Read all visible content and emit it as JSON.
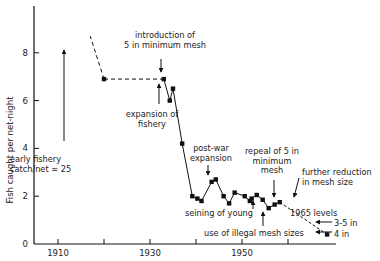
{
  "chart_data": {
    "type": "line",
    "title": "",
    "xlabel": "",
    "ylabel": "Fish caught per net-night",
    "xlim": [
      1899,
      1974
    ],
    "ylim": [
      0,
      9.8
    ],
    "grid": false,
    "legend": null,
    "x_ticks": [
      1910,
      1920,
      1930,
      1940,
      1950,
      1960
    ],
    "x_tick_labels": [
      "1910",
      "",
      "1930",
      "",
      "1950",
      ""
    ],
    "y_ticks": [
      0,
      2,
      4,
      6,
      8
    ],
    "y_tick_labels": [
      "0",
      "2",
      "4",
      "6",
      "8"
    ],
    "series": [
      {
        "name": "catch per net-night",
        "x": [
          1920,
          1933,
          1934.3,
          1935,
          1937,
          1939.2,
          1940.3,
          1941.2,
          1943.4,
          1944.3,
          1946,
          1947.2,
          1948.4,
          1950.6,
          1951.7,
          1952.1,
          1953.2,
          1954.5,
          1955.8,
          1957.1,
          1958.2
        ],
        "y": [
          6.9,
          6.9,
          6.0,
          6.5,
          4.2,
          2.0,
          1.9,
          1.8,
          2.6,
          2.7,
          2.0,
          1.7,
          2.15,
          2.0,
          1.8,
          1.9,
          2.05,
          1.85,
          1.5,
          1.65,
          1.75
        ]
      },
      {
        "name": "1965 levels (extrapolated)",
        "x": [
          1958.2,
          1968.5
        ],
        "y": [
          1.75,
          0.4
        ],
        "style": "dashed"
      }
    ],
    "early_fishery_dashed": {
      "from": [
        1920,
        6.9
      ],
      "to": [
        1917,
        8.7
      ]
    },
    "annotations": [
      {
        "text": [
          "early fishery",
          "catch/net ≃ 25"
        ],
        "x": 1913,
        "y": 6.9,
        "arrow": "up"
      },
      {
        "text": [
          "introduction of",
          "5 in minimum mesh"
        ],
        "x": 1933,
        "y": 7.9,
        "arrow": "down"
      },
      {
        "text": [
          "expansion of",
          "fishery"
        ],
        "x": 1932.5,
        "y": 5.8,
        "arrow": "up"
      },
      {
        "text": [
          "post-war",
          "expansion"
        ],
        "x": 1944,
        "y": 3.8,
        "arrow": "down"
      },
      {
        "text": [
          "seining of young"
        ],
        "x": 1951.7,
        "y": 1.2,
        "arrow": "up"
      },
      {
        "text": [
          "use of illegal mesh sizes"
        ],
        "x": 1955.8,
        "y": 0.5,
        "arrow": "up"
      },
      {
        "text": [
          "repeal of 5 in",
          "minimum",
          "mesh"
        ],
        "x": 1957.1,
        "y": 2.5,
        "arrow": "down"
      },
      {
        "text": [
          "further reduction",
          "in mesh size"
        ],
        "x": 1962,
        "y": 2.9,
        "arrow": "down"
      },
      {
        "text": [
          "1965 levels"
        ],
        "x": 1962,
        "y": 1.1
      },
      {
        "text": [
          "3-5 in"
        ],
        "x": 1969,
        "y": 0.9,
        "arrow": "left"
      },
      {
        "text": [
          "4 in"
        ],
        "x": 1969,
        "y": 0.45,
        "arrow": "left"
      }
    ]
  }
}
